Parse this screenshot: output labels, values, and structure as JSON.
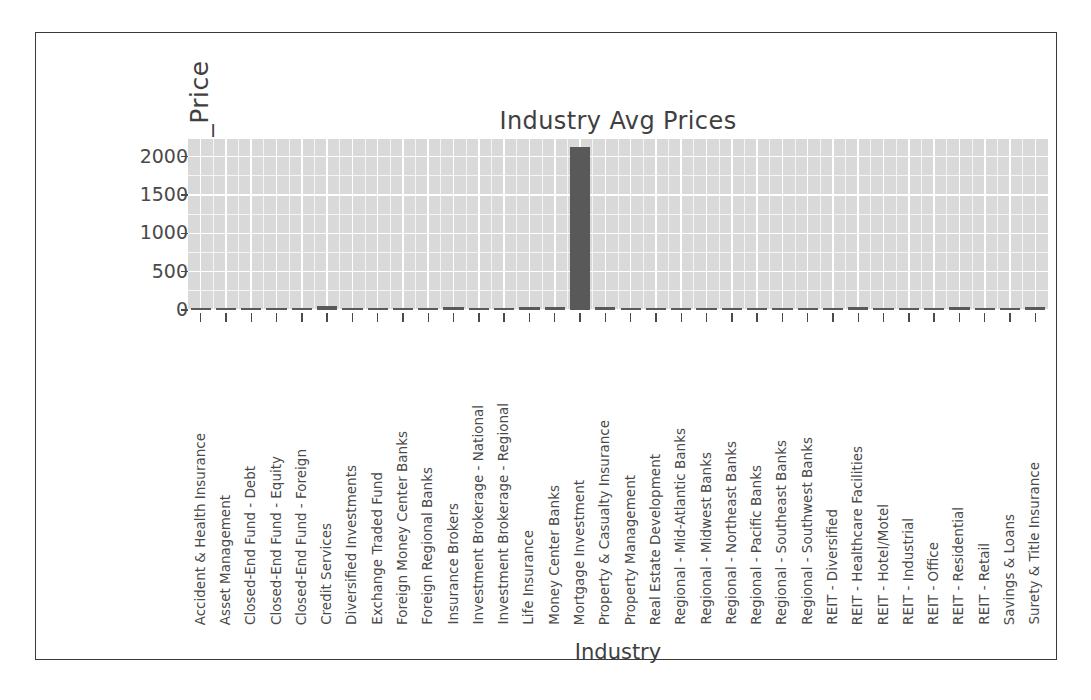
{
  "chart_data": {
    "type": "bar",
    "title": "Industry Avg Prices",
    "xlabel": "Industry",
    "ylabel": "Industry_Avg_Price",
    "ylim": [
      0,
      2230
    ],
    "yticks": [
      0,
      500,
      1000,
      1500,
      2000
    ],
    "ytick_labels": [
      "0",
      "500",
      "1000",
      "1500",
      "2000"
    ],
    "grid": true,
    "legend": "none",
    "panel_color": "#d9d9d9",
    "grid_color": "#ffffff",
    "bar_color": "#595959",
    "categories": [
      "Accident & Health Insurance",
      "Asset Management",
      "Closed-End Fund - Debt",
      "Closed-End Fund - Equity",
      "Closed-End Fund - Foreign",
      "Credit Services",
      "Diversified Investments",
      "Exchange Traded Fund",
      "Foreign Money Center Banks",
      "Foreign Regional Banks",
      "Insurance Brokers",
      "Investment Brokerage - National",
      "Investment Brokerage - Regional",
      "Life Insurance",
      "Money Center Banks",
      "Mortgage Investment",
      "Property & Casualty Insurance",
      "Property Management",
      "Real Estate Development",
      "Regional - Mid-Atlantic Banks",
      "Regional - Midwest Banks",
      "Regional - Northeast Banks",
      "Regional - Pacific Banks",
      "Regional - Southeast Banks",
      "Regional - Southwest Banks",
      "REIT - Diversified",
      "REIT - Healthcare Facilities",
      "REIT - Hotel/Motel",
      "REIT - Industrial",
      "REIT - Office",
      "REIT - Residential",
      "REIT - Retail",
      "Savings & Loans",
      "Surety & Title Insurance"
    ],
    "values": [
      28,
      31,
      12,
      14,
      11,
      55,
      22,
      19,
      13,
      12,
      36,
      17,
      15,
      33,
      38,
      2120,
      45,
      14,
      13,
      26,
      24,
      27,
      30,
      23,
      25,
      21,
      34,
      12,
      26,
      29,
      37,
      32,
      18,
      41
    ]
  }
}
